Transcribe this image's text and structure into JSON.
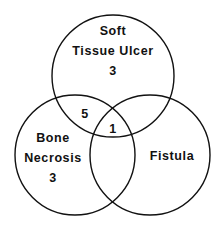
{
  "diagram": {
    "type": "venn",
    "sets": [
      {
        "name": "Soft Tissue Ulcer",
        "line1": "Soft",
        "line2": "Tissue Ulcer",
        "only_count": "3"
      },
      {
        "name": "Bone Necrosis",
        "line1": "Bone",
        "line2": "Necrosis",
        "only_count": "3"
      },
      {
        "name": "Fistula",
        "line1": "Fistula",
        "only_count": ""
      }
    ],
    "intersections": {
      "soft_tissue_ulcer_and_bone_necrosis": "5",
      "all_three": "1"
    },
    "colors": {
      "stroke": "#111111",
      "background": "#ffffff"
    }
  }
}
